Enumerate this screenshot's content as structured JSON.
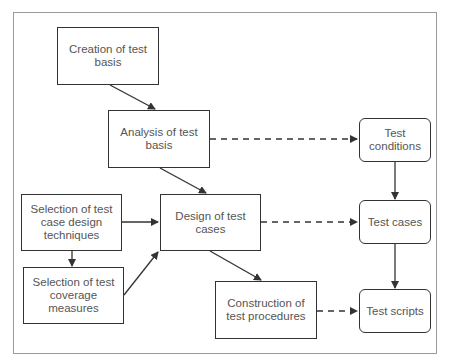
{
  "diagram": {
    "processes": [
      {
        "id": "creation",
        "label": "Creation of test basis"
      },
      {
        "id": "analysis",
        "label": "Analysis of test basis"
      },
      {
        "id": "design",
        "label": "Design of test cases"
      },
      {
        "id": "sel_design",
        "label": "Selection of test case design techniques"
      },
      {
        "id": "sel_coverage",
        "label": "Selection of test coverage measures"
      },
      {
        "id": "construction",
        "label": "Construction of test procedures"
      }
    ],
    "artifacts": [
      {
        "id": "conditions",
        "label": "Test conditions"
      },
      {
        "id": "cases",
        "label": "Test cases"
      },
      {
        "id": "scripts",
        "label": "Test scripts"
      }
    ],
    "edges": [
      {
        "from": "creation",
        "to": "analysis",
        "style": "solid"
      },
      {
        "from": "analysis",
        "to": "design",
        "style": "solid"
      },
      {
        "from": "sel_design",
        "to": "design",
        "style": "solid"
      },
      {
        "from": "sel_design",
        "to": "sel_coverage",
        "style": "solid"
      },
      {
        "from": "sel_coverage",
        "to": "design",
        "style": "solid"
      },
      {
        "from": "design",
        "to": "construction",
        "style": "solid"
      },
      {
        "from": "analysis",
        "to": "conditions",
        "style": "dashed"
      },
      {
        "from": "design",
        "to": "cases",
        "style": "dashed"
      },
      {
        "from": "construction",
        "to": "scripts",
        "style": "dashed"
      },
      {
        "from": "conditions",
        "to": "cases",
        "style": "solid"
      },
      {
        "from": "cases",
        "to": "scripts",
        "style": "solid"
      }
    ]
  }
}
